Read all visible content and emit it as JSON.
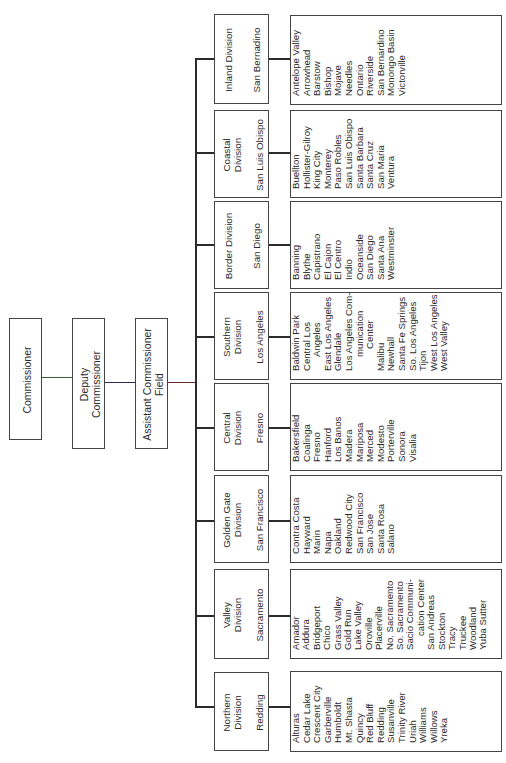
{
  "chart_title": "",
  "top_chain": [
    {
      "label": "Commissioner"
    },
    {
      "label": "Deputy Commissioner",
      "lines": [
        "Deputy",
        "Commissioner"
      ]
    },
    {
      "label": "Assistant Commissioner Field",
      "lines": [
        "Assistant Commissioner",
        "Field"
      ]
    }
  ],
  "divisions": [
    {
      "name_lines": [
        "Inland Division"
      ],
      "hq": "San Bernadino",
      "offices": [
        "Antelope Valley",
        "Arrowhead",
        "Barstow",
        "Bishop",
        "Mojave",
        "Needles",
        "Ontario",
        "Riverside",
        "San Bernardino",
        "Monongo Basin",
        "Victorville"
      ]
    },
    {
      "name_lines": [
        "Coastal",
        "Division"
      ],
      "hq": "San Luis Obispo",
      "offices": [
        "Buellton",
        "Hollister-Gilroy",
        "King City",
        "Monterey",
        "Paso Robles",
        "San Luis Obispo",
        "Santa Barbara",
        "Santa Cruz",
        "San Maria",
        "Ventura"
      ]
    },
    {
      "name_lines": [
        "Border Division"
      ],
      "hq": "San Diego",
      "offices": [
        "Banning",
        "Blythe",
        "Capistrano",
        "El Cajon",
        "El Centro",
        "Indio",
        "Oceanside",
        "San Diego",
        "Santa Ana",
        "Westminster"
      ]
    },
    {
      "name_lines": [
        "Southern",
        "Division"
      ],
      "hq": "Los Angeles",
      "offices": [
        "Baldwin Park",
        "Central Los",
        "  Angeles",
        "East Los Angeles",
        "Glendale",
        "Los Angeles Com-",
        "  munication",
        "  Center",
        "Malibu",
        "Newhall",
        "Santa Fe Springs",
        "So. Los Angeles",
        "Tijon",
        "West Los Angeles",
        "West Valley"
      ]
    },
    {
      "name_lines": [
        "Central",
        "Division"
      ],
      "hq": "Fresno",
      "offices": [
        "Bakersfield",
        "Coalinga",
        "Fresno",
        "Hanford",
        "Los Banos",
        "Madera",
        "Mariposa",
        "Merced",
        "Modesto",
        "Porterville",
        "Sonora",
        "Visalia"
      ]
    },
    {
      "name_lines": [
        "Golden Gate",
        "Division"
      ],
      "hq": "San Francisco",
      "offices": [
        "Contra Costa",
        "Hayward",
        "Marin",
        "Napa",
        "Oakland",
        "Redwood City",
        "San Francisco",
        "San Jose",
        "Santa Rosa",
        "Salano"
      ]
    },
    {
      "name_lines": [
        "Valley",
        "Division"
      ],
      "hq": "Sacramento",
      "offices": [
        "Amador",
        "Addura",
        "Bridgeport",
        "Chico",
        "Grass Valley",
        "Gold Run",
        "Lake Valley",
        "Oroville",
        "Placerville",
        "No. Sacramento",
        "So. Sacramento",
        "Sacio Communi-",
        "  cation Center",
        "San Andreas",
        "Stockton",
        "Tracy",
        "Truckee",
        "Woodland",
        "Yuba Sutter"
      ]
    },
    {
      "name_lines": [
        "Northern",
        "Division"
      ],
      "hq": "Redding",
      "offices": [
        "Alturas",
        "Cedar Lake",
        "Crescent City",
        "Garberville",
        "Humboldt",
        "Mt. Shasta",
        "Quincy",
        "Red Bluff",
        "Redding",
        "Susanville",
        "Trinity River",
        "Uriah",
        "Williams",
        "Willows",
        "Yreka"
      ]
    }
  ],
  "colors": {
    "line": "#2b2b2b",
    "border": "#444444",
    "background": "#ffffff",
    "text": "#2a2a2a"
  }
}
